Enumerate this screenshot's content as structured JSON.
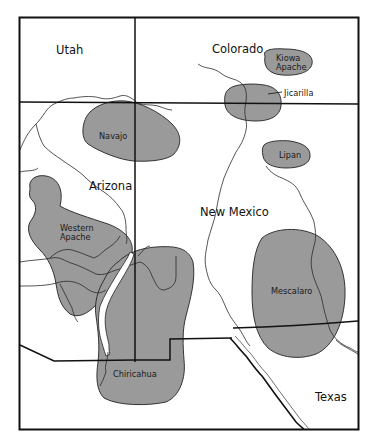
{
  "map": {
    "colors": {
      "background": "#ffffff",
      "territory_fill": "#9a9a9a",
      "lines": "#1a1a1a"
    },
    "states": [
      {
        "id": "utah",
        "label": "Utah"
      },
      {
        "id": "colorado",
        "label": "Colorado"
      },
      {
        "id": "arizona",
        "label": "Arizona"
      },
      {
        "id": "new-mexico",
        "label": "New Mexico"
      },
      {
        "id": "texas",
        "label": "Texas"
      }
    ],
    "territories": [
      {
        "id": "kiowa-apache",
        "label_line1": "Kiowa",
        "label_line2": "Apache"
      },
      {
        "id": "jicarilla",
        "label": "Jicarilla"
      },
      {
        "id": "navajo",
        "label": "Navajo"
      },
      {
        "id": "lipan",
        "label": "Lipan"
      },
      {
        "id": "western-apache",
        "label_line1": "Western",
        "label_line2": "Apache"
      },
      {
        "id": "mescalero",
        "label": "Mescalaro"
      },
      {
        "id": "chiricahua",
        "label": "Chiricahua"
      }
    ]
  }
}
